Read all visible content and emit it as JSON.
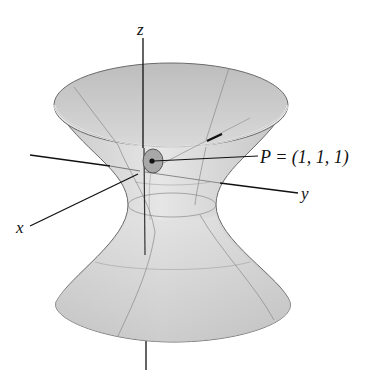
{
  "figure": {
    "surface": "hyperboloid of one sheet",
    "axes": {
      "x_label": "x",
      "y_label": "y",
      "z_label": "z"
    },
    "point": {
      "name": "P",
      "label": "P = (1, 1, 1)",
      "coordinates": [
        1,
        1,
        1
      ]
    },
    "colors": {
      "surface_fill": "#d4d4d4",
      "surface_inner": "#c8c8c8",
      "surface_edge": "#6a6a6a",
      "grid_lines": "#8a8a8a",
      "axis": "#111111",
      "tangent_patch": "#9a9a9a",
      "background": "#ffffff"
    }
  }
}
